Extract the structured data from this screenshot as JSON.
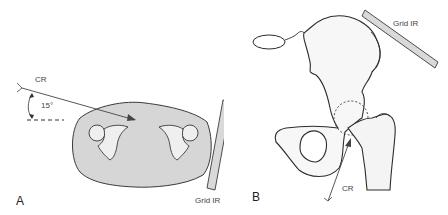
{
  "panels": [
    {
      "id": "A",
      "letter": "A",
      "view": "axial cross-section of pelvis",
      "labels": {
        "central_ray": "CR",
        "angle": "15°",
        "receptor": "Grid IR"
      }
    },
    {
      "id": "B",
      "letter": "B",
      "view": "anterior hip / pelvis with proximal femur",
      "labels": {
        "central_ray": "CR",
        "receptor": "Grid IR"
      }
    }
  ],
  "colors": {
    "outline": "#3a3a3a",
    "body_fill": "#d6d6d6",
    "bone_fill": "#efefef",
    "ir_fill": "#d9d9d9",
    "background": "#ffffff"
  }
}
